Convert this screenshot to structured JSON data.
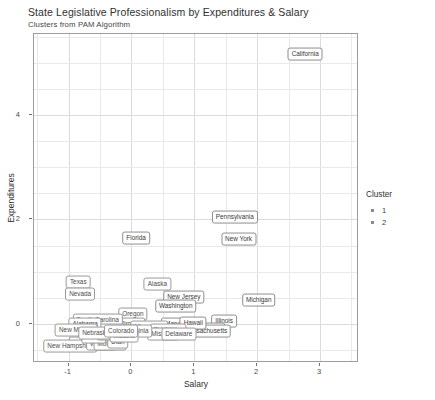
{
  "chart_data": {
    "type": "scatter",
    "title": "State Legislative Professionalism by Expenditures & Salary",
    "subtitle": "Clusters from PAM Algorithm",
    "xlabel": "Salary",
    "ylabel": "Expenditures",
    "xlim": [
      -1.55,
      3.62
    ],
    "ylim": [
      -0.75,
      5.55
    ],
    "xticks": [
      "-1",
      "0",
      "1",
      "2",
      "3"
    ],
    "xtickvals": [
      -1,
      0,
      1,
      2,
      3
    ],
    "yticks": [
      "0",
      "2",
      "4"
    ],
    "ytickvals": [
      0,
      2,
      4
    ],
    "grid": "major and minor gridlines, light gray",
    "legend": {
      "title": "Cluster",
      "position": "right",
      "entries": [
        {
          "label": "1",
          "marker": "square-dot"
        },
        {
          "label": "2",
          "marker": "square-dot"
        }
      ]
    },
    "points": [
      {
        "label": "California",
        "x": 2.78,
        "y": 5.14,
        "cluster": 1
      },
      {
        "label": "Pennsylvania",
        "x": 1.66,
        "y": 2.02,
        "cluster": 1
      },
      {
        "label": "New York",
        "x": 1.72,
        "y": 1.6,
        "cluster": 1
      },
      {
        "label": "Florida",
        "x": 0.09,
        "y": 1.62,
        "cluster": 1
      },
      {
        "label": "Michigan",
        "x": 2.04,
        "y": 0.43,
        "cluster": 1
      },
      {
        "label": "Texas",
        "x": -0.83,
        "y": 0.78,
        "cluster": 2
      },
      {
        "label": "Nevada",
        "x": -0.8,
        "y": 0.55,
        "cluster": 2
      },
      {
        "label": "Alaska",
        "x": 0.43,
        "y": 0.74,
        "cluster": 2
      },
      {
        "label": "New Jersey",
        "x": 0.85,
        "y": 0.5,
        "cluster": 1
      },
      {
        "label": "Washington",
        "x": 0.72,
        "y": 0.33,
        "cluster": 1
      },
      {
        "label": "Illinois",
        "x": 1.49,
        "y": 0.03,
        "cluster": 1
      },
      {
        "label": "Ohio",
        "x": 1.33,
        "y": -0.11,
        "cluster": 1
      },
      {
        "label": "Massachusetts",
        "x": 1.2,
        "y": -0.16,
        "cluster": 1
      },
      {
        "label": "Maryland",
        "x": 0.76,
        "y": -0.02,
        "cluster": 1
      },
      {
        "label": "Hawaii",
        "x": 1.0,
        "y": -0.01,
        "cluster": 1
      },
      {
        "label": "Oregon",
        "x": 0.04,
        "y": 0.17,
        "cluster": 2
      },
      {
        "label": "Virginia",
        "x": 0.0,
        "y": -0.03,
        "cluster": 2
      },
      {
        "label": "Minnesota",
        "x": 0.3,
        "y": -0.08,
        "cluster": 2
      },
      {
        "label": "Oklahoma",
        "x": 0.59,
        "y": -0.13,
        "cluster": 2
      },
      {
        "label": "Missouri",
        "x": 0.52,
        "y": -0.21,
        "cluster": 2
      },
      {
        "label": "Delaware",
        "x": 0.77,
        "y": -0.22,
        "cluster": 2
      },
      {
        "label": "South Carolina",
        "x": -0.52,
        "y": 0.06,
        "cluster": 2
      },
      {
        "label": "West Virginia",
        "x": -0.01,
        "y": -0.16,
        "cluster": 2
      },
      {
        "label": "Rhode Island",
        "x": -0.45,
        "y": -0.13,
        "cluster": 2
      },
      {
        "label": "Alabama",
        "x": -0.72,
        "y": -0.03,
        "cluster": 2
      },
      {
        "label": "New Mexico",
        "x": -0.86,
        "y": -0.13,
        "cluster": 2
      },
      {
        "label": "Wyoming",
        "x": -0.7,
        "y": -0.39,
        "cluster": 2
      },
      {
        "label": "Idaho",
        "x": -0.27,
        "y": -0.33,
        "cluster": 2
      },
      {
        "label": "New Hampshire",
        "x": -0.96,
        "y": -0.45,
        "cluster": 2
      },
      {
        "label": "Vermont",
        "x": -0.46,
        "y": -0.4,
        "cluster": 2
      },
      {
        "label": "Montana",
        "x": -0.33,
        "y": -0.41,
        "cluster": 2
      },
      {
        "label": "Kansas",
        "x": -0.4,
        "y": -0.25,
        "cluster": 2
      },
      {
        "label": "Maine",
        "x": -0.58,
        "y": -0.28,
        "cluster": 2
      },
      {
        "label": "Utah",
        "x": -0.2,
        "y": -0.36,
        "cluster": 2
      },
      {
        "label": "Georgia",
        "x": -0.3,
        "y": -0.22,
        "cluster": 2
      },
      {
        "label": "Nebraska",
        "x": -0.55,
        "y": -0.2,
        "cluster": 2
      },
      {
        "label": "Indiana",
        "x": -0.1,
        "y": -0.26,
        "cluster": 2
      },
      {
        "label": "Colorado",
        "x": -0.15,
        "y": -0.15,
        "cluster": 2
      }
    ]
  }
}
